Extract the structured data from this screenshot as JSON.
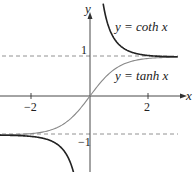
{
  "chart_data": {
    "type": "line",
    "title": "",
    "xlabel": "x",
    "ylabel": "y",
    "xlim": [
      -3.0,
      3.5
    ],
    "ylim": [
      -1.9,
      2.4
    ],
    "grid": false,
    "legend": "inline annotations",
    "x_ticks": [
      -2,
      2
    ],
    "x_tick_labels": [
      "−2",
      "2"
    ],
    "y_ticks": [
      1,
      -1
    ],
    "y_tick_labels": [
      "1",
      "−1"
    ],
    "asymptotes": [
      {
        "type": "horizontal",
        "y": 1,
        "style": "dashed"
      },
      {
        "type": "horizontal",
        "y": -1,
        "style": "dashed"
      }
    ],
    "series": [
      {
        "name": "y = coth x",
        "function": "coth",
        "color": "#222222",
        "branches": [
          {
            "x": [
              0.45,
              0.6,
              0.8,
              1.0,
              1.3,
              1.6,
              2.0,
              2.5,
              3.0
            ],
            "y": [
              2.38,
              1.86,
              1.51,
              1.31,
              1.16,
              1.08,
              1.04,
              1.01,
              1.0
            ]
          },
          {
            "x": [
              -3.0,
              -2.5,
              -2.0,
              -1.6,
              -1.3,
              -1.0,
              -0.8,
              -0.6,
              -0.45
            ],
            "y": [
              -1.0,
              -1.01,
              -1.04,
              -1.08,
              -1.16,
              -1.31,
              -1.51,
              -1.86,
              -2.38
            ]
          }
        ]
      },
      {
        "name": "y = tanh x",
        "function": "tanh",
        "color": "#888888",
        "x": [
          -3.0,
          -2.5,
          -2.0,
          -1.5,
          -1.0,
          -0.5,
          0,
          0.5,
          1.0,
          1.5,
          2.0,
          2.5,
          3.0
        ],
        "y": [
          -0.995,
          -0.987,
          -0.964,
          -0.905,
          -0.762,
          -0.462,
          0,
          0.462,
          0.762,
          0.905,
          0.964,
          0.987,
          0.995
        ]
      }
    ]
  },
  "labels": {
    "y_axis": "y",
    "x_axis": "x",
    "x_tick_neg2": "−2",
    "x_tick_2": "2",
    "y_tick_1": "1",
    "y_tick_neg1": "−1",
    "coth_label_prefix": "y = coth ",
    "tanh_label_prefix": "y = tanh ",
    "var_x": "x"
  }
}
